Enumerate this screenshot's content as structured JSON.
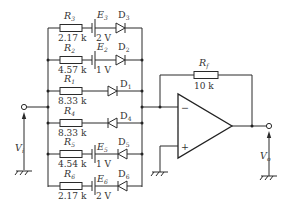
{
  "diagram": {
    "type": "circuit-schematic",
    "input": {
      "label": "V",
      "subscript": "i"
    },
    "output": {
      "label": "V",
      "subscript": "o"
    },
    "feedback_resistor": {
      "label": "R",
      "subscript": "f",
      "value": "10 k"
    },
    "opamp": {
      "inverting_sign": "−",
      "noninverting_sign": "+"
    },
    "branches": [
      {
        "resistor": "R",
        "r_sub": "3",
        "r_value": "2.17 k",
        "source": "E",
        "e_sub": "3",
        "e_value": "2 V",
        "diode": "D",
        "d_sub": "3",
        "diode_direction": "right"
      },
      {
        "resistor": "R",
        "r_sub": "2",
        "r_value": "4.57 k",
        "source": "E",
        "e_sub": "2",
        "e_value": "1 V",
        "diode": "D",
        "d_sub": "2",
        "diode_direction": "right"
      },
      {
        "resistor": "R",
        "r_sub": "1",
        "r_value": "8.33 k",
        "diode": "D",
        "d_sub": "1",
        "diode_direction": "right"
      },
      {
        "resistor": "R",
        "r_sub": "4",
        "r_value": "8.33 k",
        "diode": "D",
        "d_sub": "4",
        "diode_direction": "left"
      },
      {
        "resistor": "R",
        "r_sub": "5",
        "r_value": "4.54 k",
        "source": "E",
        "e_sub": "5",
        "e_value": "1 V",
        "diode": "D",
        "d_sub": "5",
        "diode_direction": "left"
      },
      {
        "resistor": "R",
        "r_sub": "6",
        "r_value": "2.17 k",
        "source": "E",
        "e_sub": "6",
        "e_value": "2 V",
        "diode": "D",
        "d_sub": "6",
        "diode_direction": "left"
      }
    ]
  }
}
